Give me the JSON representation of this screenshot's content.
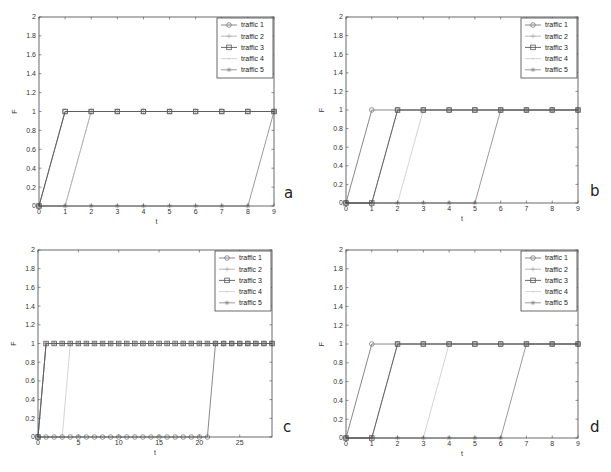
{
  "figure": {
    "panels": [
      "a",
      "b",
      "c",
      "d"
    ]
  },
  "legend_labels": [
    "traffic 1",
    "traffic 2",
    "traffic 3",
    "traffic 4",
    "traffic 5"
  ],
  "series_styles": [
    {
      "name": "traffic 1",
      "color": "#7a7a7a",
      "marker": "circle"
    },
    {
      "name": "traffic 2",
      "color": "#b0b0b0",
      "marker": "plus"
    },
    {
      "name": "traffic 3",
      "color": "#5a5a5a",
      "marker": "square"
    },
    {
      "name": "traffic 4",
      "color": "#cfcfcf",
      "marker": "dot"
    },
    {
      "name": "traffic 5",
      "color": "#8e8e8e",
      "marker": "asterisk"
    }
  ],
  "chart_data": [
    {
      "panel": "a",
      "type": "line",
      "title": "",
      "xlabel": "t",
      "ylabel": "F",
      "xlim": [
        0,
        9
      ],
      "ylim": [
        0,
        2
      ],
      "xticks": [
        0,
        1,
        2,
        3,
        4,
        5,
        6,
        7,
        8,
        9
      ],
      "yticks": [
        "0",
        "0.2",
        "0.4",
        "0.6",
        "0.8",
        "1",
        "1.2",
        "1.4",
        "1.6",
        "1.8",
        "2"
      ],
      "grid": false,
      "legend_position": "upper right",
      "bbox": {
        "left": 39,
        "top": 17,
        "right": 274,
        "bottom": 206
      },
      "letter_pos": {
        "x": 284,
        "y": 198
      },
      "x": [
        0,
        1,
        2,
        3,
        4,
        5,
        6,
        7,
        8,
        9
      ],
      "series": [
        {
          "name": "traffic 1",
          "start_t": 0
        },
        {
          "name": "traffic 2",
          "start_t": 1
        },
        {
          "name": "traffic 3",
          "start_t": 0
        },
        {
          "name": "traffic 4",
          "start_t": 1
        },
        {
          "name": "traffic 5",
          "start_t": 8
        }
      ],
      "note": "Each series is 0 until its start time, then rises to 1 one step later and stays at 1."
    },
    {
      "panel": "b",
      "type": "line",
      "title": "",
      "xlabel": "t",
      "ylabel": "F",
      "xlim": [
        0,
        9
      ],
      "ylim": [
        0,
        2
      ],
      "xticks": [
        0,
        1,
        2,
        3,
        4,
        5,
        6,
        7,
        8,
        9
      ],
      "yticks": [
        "0",
        "0.2",
        "0.4",
        "0.6",
        "0.8",
        "1",
        "1.2",
        "1.4",
        "1.6",
        "1.8",
        "2"
      ],
      "grid": false,
      "legend_position": "upper right",
      "bbox": {
        "left": 346,
        "top": 17,
        "right": 578,
        "bottom": 203
      },
      "letter_pos": {
        "x": 590,
        "y": 196
      },
      "x": [
        0,
        1,
        2,
        3,
        4,
        5,
        6,
        7,
        8,
        9
      ],
      "series": [
        {
          "name": "traffic 1",
          "start_t": 0
        },
        {
          "name": "traffic 2",
          "start_t": 1
        },
        {
          "name": "traffic 3",
          "start_t": 1
        },
        {
          "name": "traffic 4",
          "start_t": 2
        },
        {
          "name": "traffic 5",
          "start_t": 5
        }
      ]
    },
    {
      "panel": "c",
      "type": "line",
      "title": "",
      "xlabel": "t",
      "ylabel": "F",
      "xlim": [
        0,
        29
      ],
      "ylim": [
        0,
        2
      ],
      "xticks": [
        0,
        5,
        10,
        15,
        20,
        25
      ],
      "yticks": [
        "0",
        "0.2",
        "0.4",
        "0.6",
        "0.8",
        "1",
        "1.2",
        "1.4",
        "1.6",
        "1.8",
        "2"
      ],
      "grid": false,
      "legend_position": "upper right",
      "bbox": {
        "left": 38,
        "top": 250,
        "right": 272,
        "bottom": 437
      },
      "letter_pos": {
        "x": 283,
        "y": 432
      },
      "x": [
        0,
        1,
        2,
        3,
        4,
        5,
        6,
        7,
        8,
        9,
        10,
        11,
        12,
        13,
        14,
        15,
        16,
        17,
        18,
        19,
        20,
        21,
        22,
        23,
        24,
        25,
        26,
        27,
        28,
        29
      ],
      "series": [
        {
          "name": "traffic 1",
          "start_t": 21
        },
        {
          "name": "traffic 2",
          "start_t": 0
        },
        {
          "name": "traffic 3",
          "start_t": 0
        },
        {
          "name": "traffic 4",
          "start_t": 3
        },
        {
          "name": "traffic 5",
          "start_t": 0
        }
      ]
    },
    {
      "panel": "d",
      "type": "line",
      "title": "",
      "xlabel": "t",
      "ylabel": "F",
      "xlim": [
        0,
        9
      ],
      "ylim": [
        0,
        2
      ],
      "xticks": [
        0,
        1,
        2,
        3,
        4,
        5,
        6,
        7,
        8,
        9
      ],
      "yticks": [
        "0",
        "0.2",
        "0.4",
        "0.6",
        "0.8",
        "1",
        "1.2",
        "1.4",
        "1.6",
        "1.8",
        "2"
      ],
      "grid": false,
      "legend_position": "upper right",
      "bbox": {
        "left": 346,
        "top": 250,
        "right": 578,
        "bottom": 438
      },
      "letter_pos": {
        "x": 590,
        "y": 432
      },
      "x": [
        0,
        1,
        2,
        3,
        4,
        5,
        6,
        7,
        8,
        9
      ],
      "series": [
        {
          "name": "traffic 1",
          "start_t": 0
        },
        {
          "name": "traffic 2",
          "start_t": 1
        },
        {
          "name": "traffic 3",
          "start_t": 1
        },
        {
          "name": "traffic 4",
          "start_t": 3
        },
        {
          "name": "traffic 5",
          "start_t": 6
        }
      ]
    }
  ]
}
